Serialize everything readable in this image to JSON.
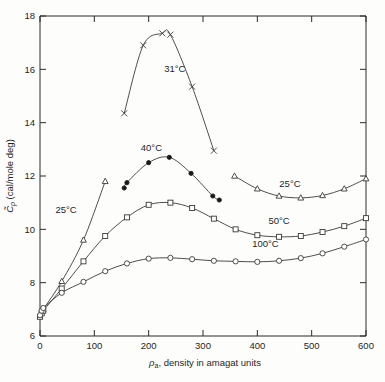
{
  "chart_data": {
    "type": "line",
    "title": "",
    "xlabel": "ρₐ, density in amagat units",
    "ylabel": "C̃ₚ (cal/mole deg)",
    "ylabel_symbol": "C",
    "ylabel_sub": "p",
    "ylabel_rest": " (cal/mole deg)",
    "xlim": [
      0,
      600
    ],
    "ylim": [
      6,
      18
    ],
    "xticks": [
      0,
      100,
      200,
      300,
      400,
      500,
      600
    ],
    "yticks": [
      6,
      8,
      10,
      12,
      14,
      16,
      18
    ],
    "xtick_labels": [
      "0",
      "100",
      "200",
      "300",
      "400",
      "500",
      "600"
    ],
    "ytick_labels": [
      "6",
      "8",
      "10",
      "12",
      "14",
      "16",
      "18"
    ],
    "grid": false,
    "legend_position": "inline-annotations",
    "series": [
      {
        "name": "31°C",
        "label": "31°C",
        "marker": "x",
        "label_x": 248,
        "label_y": 15.9,
        "x": [
          155,
          190,
          225,
          240,
          280,
          320
        ],
        "y": [
          14.35,
          16.9,
          17.35,
          17.3,
          15.35,
          12.95
        ]
      },
      {
        "name": "40°C",
        "label": "40°C",
        "marker": "filled-circle",
        "label_x": 205,
        "label_y": 12.95,
        "x": [
          155,
          160,
          200,
          238,
          278,
          318,
          330
        ],
        "y": [
          11.55,
          11.75,
          12.5,
          12.7,
          12.1,
          11.25,
          11.1
        ]
      },
      {
        "name": "25°C-low",
        "label": "25°C",
        "marker": "open-triangle",
        "label_x": 48,
        "label_y": 10.6,
        "x": [
          0,
          3,
          6,
          40,
          80,
          120
        ],
        "y": [
          6.75,
          6.9,
          7.0,
          8.05,
          9.6,
          11.8
        ]
      },
      {
        "name": "25°C-high",
        "label": "25°C",
        "marker": "open-triangle",
        "label_x": 460,
        "label_y": 11.6,
        "x": [
          358,
          400,
          440,
          480,
          520,
          560,
          600
        ],
        "y": [
          12.0,
          11.52,
          11.25,
          11.18,
          11.27,
          11.52,
          11.9
        ]
      },
      {
        "name": "50°C",
        "label": "50°C",
        "marker": "open-square",
        "label_x": 440,
        "label_y": 10.2,
        "x": [
          0,
          3,
          6,
          40,
          80,
          120,
          160,
          200,
          240,
          280,
          320,
          360,
          400,
          440,
          480,
          520,
          560,
          600
        ],
        "y": [
          6.72,
          6.85,
          6.95,
          7.78,
          8.8,
          9.75,
          10.45,
          10.92,
          11.0,
          10.8,
          10.4,
          10.0,
          9.78,
          9.72,
          9.75,
          9.9,
          10.12,
          10.42
        ]
      },
      {
        "name": "100°C",
        "label": "100°C",
        "marker": "open-circle",
        "label_x": 415,
        "label_y": 9.35,
        "x": [
          0,
          3,
          6,
          40,
          80,
          120,
          160,
          200,
          240,
          280,
          320,
          360,
          400,
          440,
          480,
          520,
          560,
          600
        ],
        "y": [
          6.78,
          6.95,
          7.05,
          7.62,
          8.03,
          8.43,
          8.72,
          8.9,
          8.93,
          8.88,
          8.82,
          8.8,
          8.78,
          8.82,
          8.92,
          9.1,
          9.35,
          9.62
        ]
      }
    ]
  },
  "figure": {
    "background_color": "#fdfdfb",
    "axis_color": "#2b2b2b",
    "line_color": "#3a3a3a"
  }
}
